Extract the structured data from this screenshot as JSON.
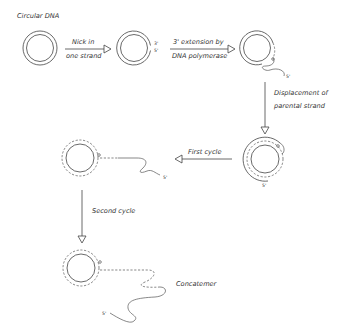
{
  "title": "Circular DNA",
  "steps": [
    {
      "id": "nick",
      "label_line1": "Nick in",
      "label_line2": "one strand"
    },
    {
      "id": "extension",
      "label_line1": "3' extension by",
      "label_line2": "DNA polymerase"
    },
    {
      "id": "displacement",
      "label_line1": "Displacement of",
      "label_line2": "parental strand"
    },
    {
      "id": "first-cycle",
      "label_line1": "First cycle"
    },
    {
      "id": "second-cycle",
      "label_line1": "Second cycle"
    }
  ],
  "end_labels": {
    "three_prime": "3'",
    "five_prime": "5'"
  },
  "product_label": "Concatemer",
  "colors": {
    "stroke": "#444444",
    "background": "#ffffff"
  }
}
